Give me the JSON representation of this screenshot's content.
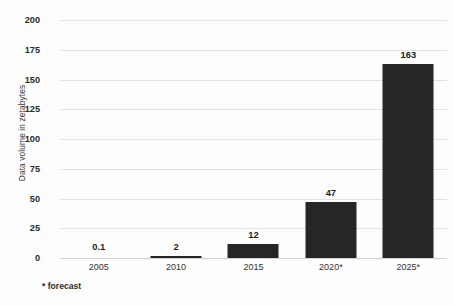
{
  "chart_data": {
    "type": "bar",
    "title": "",
    "xlabel": "",
    "ylabel": "Data volume in zetabytes",
    "categories": [
      "2005",
      "2010",
      "2015",
      "2020*",
      "2025*"
    ],
    "values": [
      0.1,
      2,
      12,
      47,
      163
    ],
    "value_labels": [
      "0.1",
      "2",
      "12",
      "47",
      "163"
    ],
    "ylim": [
      0,
      200
    ],
    "yticks": [
      0,
      25,
      50,
      75,
      100,
      125,
      150,
      175,
      200
    ],
    "ytick_labels": [
      "0",
      "25",
      "50",
      "75",
      "100",
      "125",
      "150",
      "175",
      "200"
    ],
    "grid": true,
    "legend": "none",
    "annotations": [
      "* forecast"
    ],
    "bar_color": "#262626",
    "gridline_color": "#e2e2e2",
    "background_color": "#fdfdfd"
  },
  "footnote": "* forecast"
}
